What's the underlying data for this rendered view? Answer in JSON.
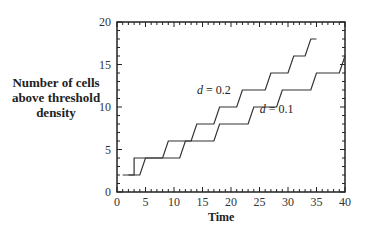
{
  "chart_data": {
    "type": "line",
    "title": "",
    "xlabel": "Time",
    "ylabel": "Number of cells above threshold density",
    "xlim": [
      0,
      40
    ],
    "ylim": [
      0,
      20
    ],
    "xticks": [
      0,
      5,
      10,
      15,
      20,
      25,
      30,
      35,
      40
    ],
    "yticks": [
      0,
      5,
      10,
      15,
      20
    ],
    "grid": false,
    "series": [
      {
        "name": "d = 0.2",
        "x": [
          2,
          3,
          3,
          8,
          9,
          13,
          14,
          17,
          18,
          21,
          22,
          26,
          27,
          30,
          31,
          33,
          34,
          35
        ],
        "y": [
          2,
          2,
          4,
          4,
          6,
          6,
          8,
          8,
          10,
          10,
          12,
          12,
          14,
          14,
          16,
          16,
          18,
          18
        ]
      },
      {
        "name": "d = 0.1",
        "x": [
          1,
          4,
          5,
          11,
          12,
          17,
          18,
          23,
          24,
          28,
          29,
          34,
          35,
          39,
          40
        ],
        "y": [
          2,
          2,
          4,
          4,
          6,
          6,
          8,
          8,
          10,
          10,
          12,
          12,
          14,
          14,
          16
        ]
      }
    ],
    "annotations": [
      {
        "text": "d = 0.2",
        "x": 17,
        "y": 11.5
      },
      {
        "text": "d = 0.1",
        "x": 28,
        "y": 9.3
      }
    ]
  },
  "labels": {
    "ylabel_line1": "Number of cells",
    "ylabel_line2": "above threshold",
    "ylabel_line3": "density",
    "xlabel": "Time"
  }
}
